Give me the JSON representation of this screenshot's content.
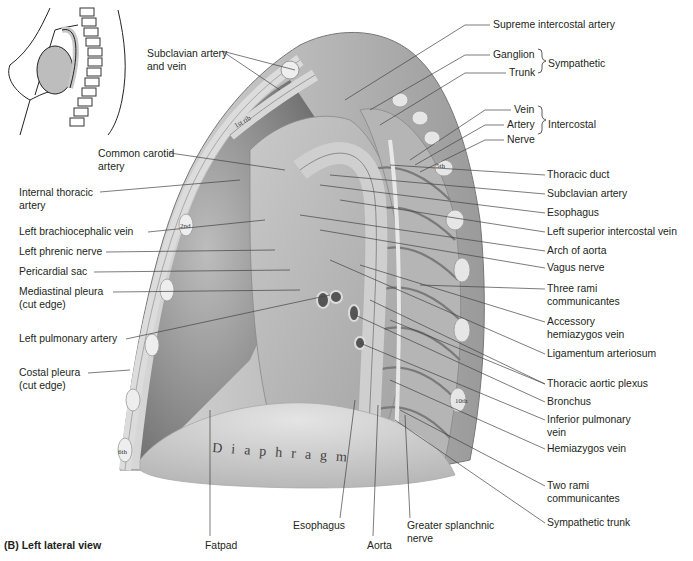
{
  "figure": {
    "caption": "(B) Left lateral view",
    "organ_text": "Diaphragm",
    "rib_labels": [
      "1st rib",
      "2nd",
      "5th",
      "6th",
      "10th"
    ]
  },
  "labels_left": [
    {
      "id": "subclavian-artery-vein",
      "text": "Subclavian artery\nand vein",
      "x": 147,
      "y": 48
    },
    {
      "id": "common-carotid-artery",
      "text": "Common carotid\nartery",
      "x": 98,
      "y": 148
    },
    {
      "id": "internal-thoracic-artery",
      "text": "Internal thoracic\nartery",
      "x": 19,
      "y": 187
    },
    {
      "id": "left-brachiocephalic-vein",
      "text": "Left brachiocephalic vein",
      "x": 19,
      "y": 226
    },
    {
      "id": "left-phrenic-nerve",
      "text": "Left phrenic nerve",
      "x": 19,
      "y": 246
    },
    {
      "id": "pericardial-sac",
      "text": "Pericardial sac",
      "x": 19,
      "y": 266
    },
    {
      "id": "mediastinal-pleura",
      "text": "Mediastinal pleura\n(cut edge)",
      "x": 19,
      "y": 286
    },
    {
      "id": "left-pulmonary-artery",
      "text": "Left pulmonary artery",
      "x": 19,
      "y": 333
    },
    {
      "id": "costal-pleura",
      "text": "Costal pleura\n(cut edge)",
      "x": 19,
      "y": 367
    }
  ],
  "labels_right": [
    {
      "id": "supreme-intercostal-artery",
      "text": "Supreme intercostal artery",
      "x": 493,
      "y": 19
    },
    {
      "id": "ganglion",
      "text": "Ganglion",
      "x": 493,
      "y": 49
    },
    {
      "id": "trunk",
      "text": "Trunk",
      "x": 509,
      "y": 67
    },
    {
      "id": "vein",
      "text": "Vein",
      "x": 514,
      "y": 104
    },
    {
      "id": "artery",
      "text": "Artery",
      "x": 507,
      "y": 119
    },
    {
      "id": "nerve",
      "text": "Nerve",
      "x": 507,
      "y": 134
    },
    {
      "id": "thoracic-duct",
      "text": "Thoracic duct",
      "x": 547,
      "y": 169
    },
    {
      "id": "subclavian-artery",
      "text": "Subclavian artery",
      "x": 547,
      "y": 188
    },
    {
      "id": "esophagus-upper",
      "text": "Esophagus",
      "x": 547,
      "y": 207
    },
    {
      "id": "left-superior-intercostal-vein",
      "text": "Left superior intercostal vein",
      "x": 547,
      "y": 226
    },
    {
      "id": "arch-of-aorta",
      "text": "Arch of aorta",
      "x": 547,
      "y": 245
    },
    {
      "id": "vagus-nerve",
      "text": "Vagus nerve",
      "x": 547,
      "y": 262
    },
    {
      "id": "three-rami-communicantes",
      "text": "Three rami\ncommunicantes",
      "x": 547,
      "y": 283
    },
    {
      "id": "accessory-hemiazygos-vein",
      "text": "Accessory\nhemiazygos vein",
      "x": 547,
      "y": 316
    },
    {
      "id": "ligamentum-arteriosum",
      "text": "Ligamentum arteriosum",
      "x": 547,
      "y": 348
    },
    {
      "id": "thoracic-aortic-plexus",
      "text": "Thoracic aortic plexus",
      "x": 547,
      "y": 378
    },
    {
      "id": "bronchus",
      "text": "Bronchus",
      "x": 547,
      "y": 396
    },
    {
      "id": "inferior-pulmonary-vein",
      "text": "Inferior pulmonary\nvein",
      "x": 547,
      "y": 414
    },
    {
      "id": "hemiazygos-vein",
      "text": "Hemiazygos vein",
      "x": 547,
      "y": 443
    },
    {
      "id": "two-rami-communicantes",
      "text": "Two rami\ncommunicantes",
      "x": 547,
      "y": 480
    },
    {
      "id": "sympathetic-trunk",
      "text": "Sympathetic trunk",
      "x": 547,
      "y": 517
    }
  ],
  "brace_groups": [
    {
      "id": "sympathetic",
      "text": "Sympathetic",
      "x": 547,
      "y": 58
    },
    {
      "id": "intercostal",
      "text": "Intercostal",
      "x": 547,
      "y": 119
    }
  ],
  "labels_bottom": [
    {
      "id": "fatpad",
      "text": "Fatpad",
      "x": 205,
      "y": 540
    },
    {
      "id": "esophagus-lower",
      "text": "Esophagus",
      "x": 293,
      "y": 520
    },
    {
      "id": "aorta",
      "text": "Aorta",
      "x": 367,
      "y": 540
    },
    {
      "id": "greater-splanchnic-nerve",
      "text": "Greater splanchnic\nnerve",
      "x": 407,
      "y": 520
    }
  ]
}
